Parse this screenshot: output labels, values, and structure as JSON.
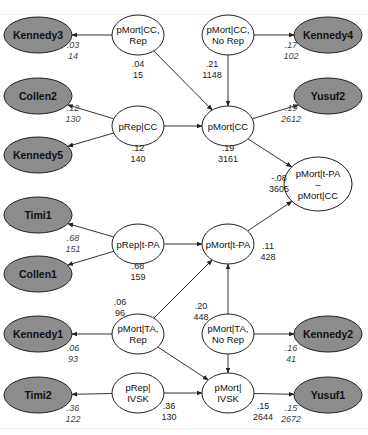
{
  "colors": {
    "study_fill": "#8c8c8c",
    "param_fill": "#ffffff",
    "stroke": "#222222",
    "edge": "#333333"
  },
  "nodes": {
    "kennedy3": {
      "label": [
        "Kennedy3"
      ],
      "type": "study",
      "cx": 38,
      "cy": 35,
      "rx": 34,
      "ry": 18
    },
    "pmort_cc_rep": {
      "label": [
        "pMort|CC,",
        "Rep"
      ],
      "type": "param",
      "cx": 138,
      "cy": 35,
      "rx": 26,
      "ry": 20
    },
    "pmort_cc_norep": {
      "label": [
        "pMort|CC,",
        "No Rep"
      ],
      "type": "param",
      "cx": 228,
      "cy": 35,
      "rx": 26,
      "ry": 20
    },
    "kennedy4": {
      "label": [
        "Kennedy4"
      ],
      "type": "study",
      "cx": 328,
      "cy": 35,
      "rx": 34,
      "ry": 18
    },
    "collen2": {
      "label": [
        "Collen2"
      ],
      "type": "study",
      "cx": 38,
      "cy": 96,
      "rx": 34,
      "ry": 18
    },
    "yusuf2": {
      "label": [
        "Yusuf2"
      ],
      "type": "study",
      "cx": 328,
      "cy": 96,
      "rx": 34,
      "ry": 18
    },
    "prep_cc": {
      "label": [
        "pRep|CC"
      ],
      "type": "param",
      "cx": 138,
      "cy": 126,
      "rx": 26,
      "ry": 20
    },
    "pmort_cc": {
      "label": [
        "pMort|CC"
      ],
      "type": "param",
      "cx": 228,
      "cy": 126,
      "rx": 26,
      "ry": 20
    },
    "kennedy5": {
      "label": [
        "Kennedy5"
      ],
      "type": "study",
      "cx": 38,
      "cy": 155,
      "rx": 34,
      "ry": 18
    },
    "pmort_diff": {
      "label": [
        "pMort|t-PA",
        "–",
        "pMort|CC"
      ],
      "type": "param",
      "cx": 318,
      "cy": 184,
      "rx": 34,
      "ry": 27
    },
    "timi1": {
      "label": [
        "Timi1"
      ],
      "type": "study",
      "cx": 38,
      "cy": 215,
      "rx": 34,
      "ry": 18
    },
    "prep_tpa": {
      "label": [
        "pRep|t-PA"
      ],
      "type": "param",
      "cx": 138,
      "cy": 244,
      "rx": 26,
      "ry": 20
    },
    "pmort_tpa": {
      "label": [
        "pMort|t-PA"
      ],
      "type": "param",
      "cx": 228,
      "cy": 244,
      "rx": 26,
      "ry": 20
    },
    "collen1": {
      "label": [
        "Collen1"
      ],
      "type": "study",
      "cx": 38,
      "cy": 274,
      "rx": 34,
      "ry": 18
    },
    "kennedy1": {
      "label": [
        "Kennedy1"
      ],
      "type": "study",
      "cx": 38,
      "cy": 334,
      "rx": 34,
      "ry": 18
    },
    "pmort_ta_rep": {
      "label": [
        "pMort|TA,",
        "Rep"
      ],
      "type": "param",
      "cx": 138,
      "cy": 334,
      "rx": 26,
      "ry": 20
    },
    "pmort_ta_norep": {
      "label": [
        "pMort|TA,",
        "No Rep"
      ],
      "type": "param",
      "cx": 228,
      "cy": 334,
      "rx": 26,
      "ry": 20
    },
    "kennedy2": {
      "label": [
        "Kennedy2"
      ],
      "type": "study",
      "cx": 328,
      "cy": 334,
      "rx": 34,
      "ry": 18
    },
    "timi2": {
      "label": [
        "Timi2"
      ],
      "type": "study",
      "cx": 38,
      "cy": 395,
      "rx": 34,
      "ry": 18
    },
    "prep_ivsk": {
      "label": [
        "pRep|",
        "IVSK"
      ],
      "type": "param",
      "cx": 138,
      "cy": 393,
      "rx": 26,
      "ry": 20
    },
    "pmort_ivsk": {
      "label": [
        "pMort|",
        "IVSK"
      ],
      "type": "param",
      "cx": 228,
      "cy": 393,
      "rx": 26,
      "ry": 20
    },
    "yusuf1": {
      "label": [
        "Yusuf1"
      ],
      "type": "study",
      "cx": 328,
      "cy": 395,
      "rx": 34,
      "ry": 18
    }
  },
  "edges": [
    {
      "from": "pmort_cc_rep",
      "to": "kennedy3"
    },
    {
      "from": "pmort_cc_norep",
      "to": "kennedy4"
    },
    {
      "from": "pmort_cc_rep",
      "to": "pmort_cc"
    },
    {
      "from": "pmort_cc_norep",
      "to": "pmort_cc"
    },
    {
      "from": "prep_cc",
      "to": "collen2"
    },
    {
      "from": "prep_cc",
      "to": "kennedy5"
    },
    {
      "from": "prep_cc",
      "to": "pmort_cc"
    },
    {
      "from": "pmort_cc",
      "to": "yusuf2"
    },
    {
      "from": "pmort_cc",
      "to": "pmort_diff"
    },
    {
      "from": "prep_tpa",
      "to": "timi1"
    },
    {
      "from": "prep_tpa",
      "to": "collen1"
    },
    {
      "from": "prep_tpa",
      "to": "pmort_tpa"
    },
    {
      "from": "pmort_tpa",
      "to": "pmort_diff"
    },
    {
      "from": "pmort_ta_rep",
      "to": "pmort_tpa"
    },
    {
      "from": "pmort_ta_norep",
      "to": "pmort_tpa"
    },
    {
      "from": "pmort_ta_rep",
      "to": "kennedy1"
    },
    {
      "from": "pmort_ta_norep",
      "to": "kennedy2"
    },
    {
      "from": "pmort_ta_rep",
      "to": "pmort_ivsk"
    },
    {
      "from": "pmort_ta_norep",
      "to": "pmort_ivsk"
    },
    {
      "from": "prep_ivsk",
      "to": "timi2"
    },
    {
      "from": "prep_ivsk",
      "to": "pmort_ivsk"
    },
    {
      "from": "pmort_ivsk",
      "to": "yusuf1"
    }
  ],
  "estimates": [
    {
      "node": "pmort_cc_rep",
      "value": ".04",
      "n": "15",
      "x": 138,
      "y": 67,
      "italic": false
    },
    {
      "node": "pmort_cc_norep",
      "value": ".21",
      "n": "1148",
      "x": 212,
      "y": 67,
      "italic": false
    },
    {
      "node": "prep_cc",
      "value": ".12",
      "n": "140",
      "x": 138,
      "y": 151,
      "italic": false
    },
    {
      "node": "pmort_cc",
      "value": ".19",
      "n": "3161",
      "x": 228,
      "y": 151,
      "italic": false
    },
    {
      "node": "pmort_diff",
      "value": "-.08",
      "n": "3605",
      "x": 279,
      "y": 181,
      "italic": false
    },
    {
      "node": "prep_tpa",
      "value": ".68",
      "n": "159",
      "x": 138,
      "y": 269,
      "italic": false
    },
    {
      "node": "pmort_tpa",
      "value": ".11",
      "n": "428",
      "x": 268,
      "y": 249,
      "italic": false
    },
    {
      "node": "pmort_ta_rep",
      "value": ".06",
      "n": "96",
      "x": 120,
      "y": 305,
      "italic": false
    },
    {
      "node": "pmort_ta_norep",
      "value": ".20",
      "n": "448",
      "x": 201,
      "y": 309,
      "italic": false
    },
    {
      "node": "prep_ivsk",
      "value": ".36",
      "n": "130",
      "x": 169,
      "y": 409,
      "italic": false
    },
    {
      "node": "pmort_ivsk",
      "value": ".15",
      "n": "2644",
      "x": 263,
      "y": 409,
      "italic": false
    }
  ],
  "observations": [
    {
      "study": "kennedy3",
      "value": ".03",
      "n": "14",
      "x": 73,
      "y": 48
    },
    {
      "study": "kennedy4",
      "value": ".17",
      "n": "102",
      "x": 291,
      "y": 48
    },
    {
      "study": "collen2",
      "value": ".12",
      "n": "130",
      "x": 73,
      "y": 111
    },
    {
      "study": "yusuf2",
      "value": ".19",
      "n": "2612",
      "x": 291,
      "y": 111
    },
    {
      "study": "timi1",
      "value": ".68",
      "n": "151",
      "x": 73,
      "y": 241
    },
    {
      "study": "kennedy1",
      "value": ".06",
      "n": "93",
      "x": 73,
      "y": 351
    },
    {
      "study": "kennedy2",
      "value": ".16",
      "n": "41",
      "x": 291,
      "y": 351
    },
    {
      "study": "timi2",
      "value": ".36",
      "n": "122",
      "x": 73,
      "y": 411
    },
    {
      "study": "yusuf1",
      "value": ".15",
      "n": "2672",
      "x": 291,
      "y": 411
    }
  ]
}
